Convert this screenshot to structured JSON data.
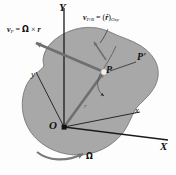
{
  "figure": {
    "background_color": "#fdfdfd",
    "body_fill": "#a8a8a8",
    "body_stroke": "#6e6e6e",
    "vector_color": "#6f6f6f",
    "axis_color": "#1a1a1a"
  },
  "axes": {
    "capital_y": "Y",
    "capital_x": "X",
    "lower_y": "y",
    "lower_x": "x"
  },
  "origin": {
    "label": "O"
  },
  "points": {
    "p": "P",
    "p_prime": "P'"
  },
  "vectors": {
    "position_r": "r",
    "omega": "Ω",
    "v_p_lhs": "v",
    "v_p_sub": "P",
    "v_p_rhs_eq": " = ",
    "v_p_omega": "Ω",
    "v_p_cross": " × ",
    "v_p_r": "r",
    "v_rel_lhs": "v",
    "v_rel_sub": "P/B",
    "v_rel_eq": " = ",
    "v_rel_open": "(",
    "v_rel_rdot": "ṙ",
    "v_rel_close": ")",
    "v_rel_frame": "Oxy"
  }
}
